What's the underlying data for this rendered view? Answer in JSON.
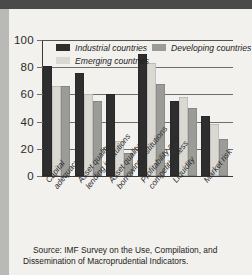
{
  "figure": {
    "source_note": "Source: IMF Survey on the Use, Compilation, and Dissemination of Macroprudential Indicators."
  },
  "colors": {
    "industrial": "#2e2e2e",
    "emerging": "#d9d8d3",
    "developing": "#9b9b98",
    "gridline": "#6e6e6e",
    "page_background": "#f2f1ee",
    "outer_background": "#b9b9b7",
    "top_band": "#4a4a4a",
    "text": "#2b2b2b"
  },
  "legend": {
    "row1": [
      {
        "label": "Industrial countries",
        "series": "industrial"
      },
      {
        "label": "Developing countries",
        "series": "developing"
      }
    ],
    "row2": [
      {
        "label": "Emerging countries",
        "series": "emerging"
      }
    ]
  },
  "chart_data": {
    "type": "bar",
    "title": "",
    "subtitle": "",
    "xlabel": "",
    "ylabel": "",
    "ylim": [
      0,
      100
    ],
    "yticks": [
      0,
      20,
      40,
      60,
      80,
      100
    ],
    "ytick_labels": [
      "0",
      "20",
      "40",
      "60",
      "80",
      "100"
    ],
    "grid": true,
    "legend_position": "top-inside",
    "categories": [
      "Capital adequacy",
      "Asset quality: lending institutions",
      "Asset quality: borrowing institutions",
      "Profitability and competitiveness",
      "Liquidity",
      "Market risk"
    ],
    "category_lines": [
      [
        "Capital",
        "adequacy"
      ],
      [
        "Asset quality:",
        "lending institutions"
      ],
      [
        "Asset quality:",
        "borrowing institutions"
      ],
      [
        "Profitability and",
        "competitiveness"
      ],
      [
        "Liquidity"
      ],
      [
        "Market risk"
      ]
    ],
    "series": [
      {
        "name": "Industrial countries",
        "key": "industrial",
        "values": [
          81,
          76,
          60,
          90,
          55,
          44
        ]
      },
      {
        "name": "Emerging countries",
        "key": "emerging",
        "values": [
          66,
          60,
          26,
          83,
          58,
          38
        ]
      },
      {
        "name": "Developing countries",
        "key": "developing",
        "values": [
          66,
          55,
          17,
          68,
          50,
          27
        ]
      }
    ],
    "series_order_in_group": [
      "industrial",
      "emerging",
      "developing"
    ]
  }
}
